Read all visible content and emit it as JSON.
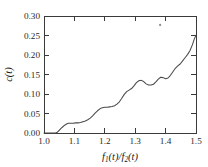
{
  "chart_data": {
    "type": "line",
    "title": "",
    "subtitle": "",
    "xlabel": "f1(t)/f2(t)",
    "xlabel_parts": {
      "f_main": "f",
      "sub1": "1",
      "arg1": "(t)",
      "slash": "/",
      "f_main2": "f",
      "sub2": "2",
      "arg2": "(t)"
    },
    "ylabel": "c(t)",
    "ylabel_parts": {
      "c_main": "c",
      "arg": "(t)"
    },
    "xlim": [
      1.0,
      1.5
    ],
    "ylim": [
      0.0,
      0.3
    ],
    "xticks": [
      1.0,
      1.1,
      1.2,
      1.3,
      1.4,
      1.5
    ],
    "xticklabels": [
      "1.0",
      "1.1",
      "1.2",
      "1.3",
      "1.4",
      "1.5"
    ],
    "yticks": [
      0.0,
      0.05,
      0.1,
      0.15,
      0.2,
      0.25,
      0.3
    ],
    "yticklabels": [
      "0.00",
      "0.05",
      "0.10",
      "0.15",
      "0.20",
      "0.25",
      "0.30"
    ],
    "grid": false,
    "legend": null,
    "legend_position": "none",
    "series": [
      {
        "name": "c(t)",
        "color": "#4a4a4a",
        "x": [
          1.0,
          1.01,
          1.02,
          1.03,
          1.038,
          1.044,
          1.05,
          1.056,
          1.062,
          1.068,
          1.074,
          1.08,
          1.088,
          1.096,
          1.104,
          1.112,
          1.12,
          1.128,
          1.136,
          1.144,
          1.152,
          1.16,
          1.168,
          1.176,
          1.184,
          1.192,
          1.2,
          1.208,
          1.216,
          1.224,
          1.232,
          1.24,
          1.248,
          1.256,
          1.264,
          1.272,
          1.28,
          1.288,
          1.296,
          1.304,
          1.312,
          1.32,
          1.328,
          1.336,
          1.344,
          1.352,
          1.36,
          1.368,
          1.376,
          1.384,
          1.392,
          1.4,
          1.408,
          1.416,
          1.424,
          1.432,
          1.44,
          1.448,
          1.456,
          1.464,
          1.472,
          1.48,
          1.488,
          1.494,
          1.5
        ],
        "y": [
          0.0,
          0.0,
          0.0,
          0.0,
          0.0,
          0.002,
          0.007,
          0.012,
          0.016,
          0.02,
          0.023,
          0.025,
          0.025,
          0.025,
          0.026,
          0.026,
          0.027,
          0.029,
          0.031,
          0.034,
          0.038,
          0.044,
          0.051,
          0.057,
          0.062,
          0.065,
          0.066,
          0.066,
          0.067,
          0.068,
          0.07,
          0.074,
          0.08,
          0.089,
          0.099,
          0.106,
          0.11,
          0.114,
          0.121,
          0.129,
          0.134,
          0.135,
          0.132,
          0.126,
          0.123,
          0.123,
          0.125,
          0.131,
          0.138,
          0.143,
          0.142,
          0.139,
          0.141,
          0.148,
          0.157,
          0.166,
          0.172,
          0.177,
          0.185,
          0.193,
          0.201,
          0.211,
          0.226,
          0.24,
          0.251
        ]
      }
    ],
    "annotations": [
      {
        "name": "stray-mark",
        "type": "point",
        "x": 1.382,
        "y": 0.277,
        "color": "#8a8a8a"
      }
    ]
  }
}
